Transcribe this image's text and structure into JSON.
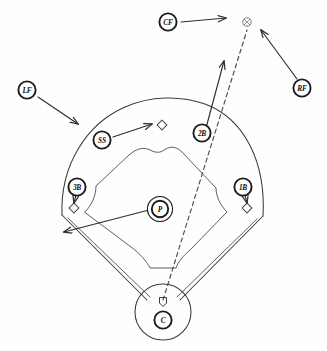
{
  "diagram": {
    "background_color": "#fefefe",
    "ink_color": "#3a3a3c",
    "sport": "baseball"
  },
  "field": {
    "name": "baseball-field",
    "elements": [
      {
        "name": "outfield-arc",
        "label": "outfield boundary"
      },
      {
        "name": "infield-dirt-edge",
        "label": "infield grass edge"
      },
      {
        "name": "left-foul-line",
        "label": "left field foul line"
      },
      {
        "name": "right-foul-line",
        "label": "right field foul line"
      },
      {
        "name": "home-plate-circle",
        "label": "home plate circle"
      }
    ]
  },
  "bases": [
    {
      "name": "first-base",
      "label": "1B",
      "x": 247,
      "y": 208
    },
    {
      "name": "second-base",
      "label": "2B",
      "x": 162,
      "y": 125
    },
    {
      "name": "third-base",
      "label": "3B",
      "x": 74,
      "y": 208
    },
    {
      "name": "home-plate",
      "label": "HP",
      "x": 163,
      "y": 302
    }
  ],
  "players": [
    {
      "name": "center-fielder",
      "code": "CF",
      "position": "Center Field",
      "x": 168,
      "y": 22,
      "movement": "sprints right toward the ball"
    },
    {
      "name": "right-fielder",
      "code": "RF",
      "position": "Right Field",
      "x": 302,
      "y": 88,
      "movement": "charges up and left to the ball"
    },
    {
      "name": "left-fielder",
      "code": "LF",
      "position": "Left Field",
      "x": 27,
      "y": 90,
      "movement": "breaks down and right for backup"
    },
    {
      "name": "shortstop",
      "code": "SS",
      "position": "Shortstop",
      "x": 102,
      "y": 140,
      "movement": "moves right to cover second base"
    },
    {
      "name": "second-baseman",
      "code": "2B",
      "position": "Second Base",
      "x": 202,
      "y": 133,
      "movement": "drops back into short right field as cutoff"
    },
    {
      "name": "third-baseman",
      "code": "3B",
      "position": "Third Base",
      "x": 77,
      "y": 187,
      "movement": "retreats down to cover third base"
    },
    {
      "name": "first-baseman",
      "code": "1B",
      "position": "First Base",
      "x": 243,
      "y": 187,
      "movement": "retreats down to cover first base"
    },
    {
      "name": "pitcher",
      "code": "P",
      "position": "Pitcher",
      "x": 160,
      "y": 209,
      "movement": "breaks toward the third base foul line to back up"
    },
    {
      "name": "catcher",
      "code": "C",
      "position": "Catcher",
      "x": 163,
      "y": 320,
      "movement": "holds at home plate"
    }
  ],
  "ball": {
    "name": "batted-ball",
    "label": "ball",
    "x": 247,
    "y": 22,
    "trajectory": "deep fly ball from home plate to right-center field"
  },
  "arrows": [
    {
      "name": "cf-movement-arrow",
      "from": "CF",
      "to": "ball area",
      "style": "solid"
    },
    {
      "name": "rf-movement-arrow",
      "from": "RF",
      "to": "ball",
      "style": "solid"
    },
    {
      "name": "lf-movement-arrow",
      "from": "LF",
      "to": "left center field",
      "style": "solid"
    },
    {
      "name": "ss-movement-arrow",
      "from": "SS",
      "to": "second base",
      "style": "solid"
    },
    {
      "name": "2b-movement-arrow",
      "from": "2B",
      "to": "short right field",
      "style": "solid"
    },
    {
      "name": "3b-movement-arrow",
      "from": "3B",
      "to": "third base",
      "style": "solid"
    },
    {
      "name": "1b-movement-arrow",
      "from": "1B",
      "to": "first base",
      "style": "solid"
    },
    {
      "name": "pitcher-movement-arrow",
      "from": "P",
      "to": "third base line",
      "style": "solid"
    },
    {
      "name": "ball-trajectory-line",
      "from": "home plate",
      "to": "ball",
      "style": "dashed"
    }
  ]
}
